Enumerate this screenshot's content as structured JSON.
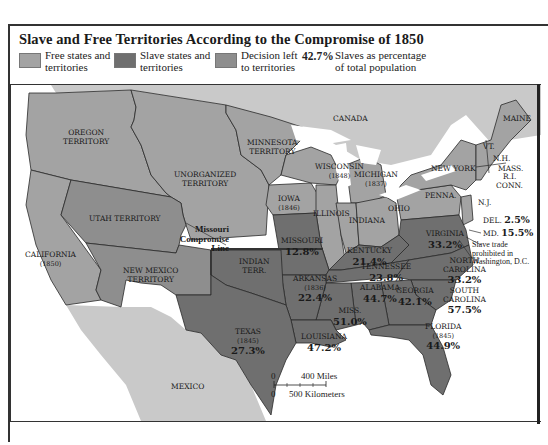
{
  "title": "Slave and Free Territories According to the Compromise of 1850",
  "colors": {
    "free": "#a3a3a3",
    "slave": "#6f6f6f",
    "decision": "#8e8e8e",
    "foreign": "#c9c9c9",
    "water": "#ffffff",
    "border": "#2a2a2a"
  },
  "legend": [
    {
      "swatch": "free",
      "label_1": "Free states and",
      "label_2": "territories"
    },
    {
      "swatch": "slave",
      "label_1": "Slave states and",
      "label_2": "territories"
    },
    {
      "swatch": "decision",
      "label_1": "Decision left",
      "label_2": "to territories"
    },
    {
      "value": "42.7%",
      "label_1": "Slaves as percentage",
      "label_2": "of total population"
    }
  ],
  "regions": {
    "canada": {
      "name": "CANADA"
    },
    "mexico": {
      "name": "MEXICO"
    },
    "oregon": {
      "name_1": "OREGON",
      "name_2": "TERRITORY"
    },
    "unorganized": {
      "name_1": "UNORGANIZED",
      "name_2": "TERRITORY"
    },
    "minnesota": {
      "name_1": "MINNESOTA",
      "name_2": "TERRITORY"
    },
    "utah": {
      "name": "UTAH TERRITORY"
    },
    "new_mexico": {
      "name_1": "NEW MEXICO",
      "name_2": "TERRITORY"
    },
    "california": {
      "name": "CALIFORNIA",
      "year": "(1850)"
    },
    "wisconsin": {
      "name": "WISCONSIN",
      "year": "(1848)"
    },
    "michigan": {
      "name": "MICHIGAN",
      "year": "(1837)"
    },
    "iowa": {
      "name": "IOWA",
      "year": "(1846)"
    },
    "illinois": {
      "name": "ILLINOIS"
    },
    "indiana": {
      "name": "INDIANA"
    },
    "ohio": {
      "name": "OHIO"
    },
    "penna": {
      "name": "PENNA."
    },
    "new_york": {
      "name": "NEW YORK"
    },
    "maine": {
      "name": "MAINE"
    },
    "vt": {
      "name": "VT."
    },
    "nh": {
      "name": "N.H."
    },
    "mass": {
      "name": "MASS."
    },
    "ri": {
      "name": "R.I."
    },
    "conn": {
      "name": "CONN."
    },
    "nj": {
      "name": "N.J."
    },
    "del": {
      "name": "DEL.",
      "pct": "2.5%"
    },
    "md": {
      "name": "MD.",
      "pct": "15.5%"
    },
    "missouri": {
      "name": "MISSOURI",
      "pct": "12.8%"
    },
    "kentucky": {
      "name": "KENTUCKY",
      "pct": "21.4%"
    },
    "virginia": {
      "name": "VIRGINIA",
      "pct": "33.2%"
    },
    "north_carolina": {
      "name_1": "NORTH",
      "name_2": "CAROLINA",
      "pct": "33.2%"
    },
    "tennessee": {
      "name": "TENNESSEE",
      "pct": "23.8%"
    },
    "south_carolina": {
      "name_1": "SOUTH",
      "name_2": "CAROLINA",
      "pct": "57.5%"
    },
    "indian_terr": {
      "name_1": "INDIAN",
      "name_2": "TERR."
    },
    "arkansas": {
      "name": "ARKANSAS",
      "year": "(1836)",
      "pct": "22.4%"
    },
    "texas": {
      "name": "TEXAS",
      "year": "(1845)",
      "pct": "27.3%"
    },
    "louisiana": {
      "name": "LOUISIANA",
      "pct": "47.2%"
    },
    "miss": {
      "name": "MISS.",
      "pct": "51.0%"
    },
    "alabama": {
      "name": "ALABAMA",
      "pct": "44.7%"
    },
    "georgia": {
      "name": "GEORGIA",
      "pct": "42.1%"
    },
    "florida": {
      "name": "FLORIDA",
      "year": "(1845)",
      "pct": "44.9%"
    }
  },
  "annotations": {
    "missouri_line_1": "Missouri",
    "missouri_line_2": "Compromise",
    "missouri_line_3": "Line",
    "dc_note_1": "Slave trade",
    "dc_note_2": "prohibited in",
    "dc_note_3": "Washington, D.C."
  },
  "scale": {
    "zero_top": "0",
    "miles": "400 Miles",
    "zero_bottom": "0",
    "km": "500 Kilometers"
  }
}
